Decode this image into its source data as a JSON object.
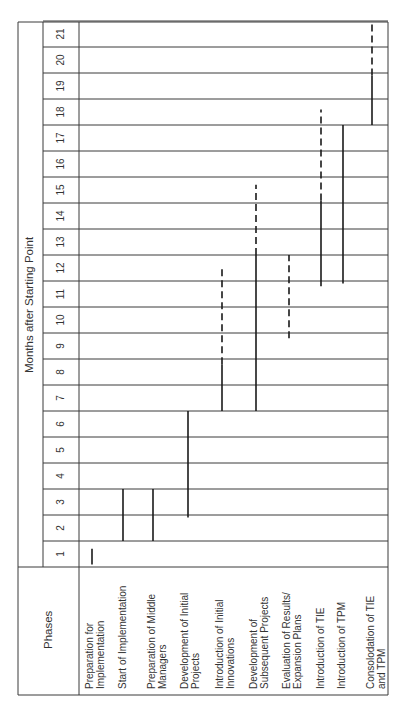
{
  "chart_data": {
    "type": "gantt",
    "orientation": "rotated 90deg counter-clockwise (months run bottom-to-top, phases left-to-right)",
    "title": "",
    "row_header": "Phases",
    "column_header": "Months after Starting Point",
    "months": [
      "1",
      "2",
      "3",
      "4",
      "5",
      "6",
      "7",
      "8",
      "9",
      "10",
      "11",
      "12",
      "13",
      "14",
      "15",
      "16",
      "17",
      "18",
      "19",
      "20",
      "21"
    ],
    "legend": {
      "solid": "planned / firm",
      "dashed": "tentative / continuation"
    },
    "phases": [
      {
        "label": "Preparation for\nImplementation",
        "segments": [
          {
            "start": 0.1,
            "end": 0.7,
            "style": "solid"
          }
        ]
      },
      {
        "label": "Start of Implementation",
        "segments": [
          {
            "start": 1.0,
            "end": 3.0,
            "style": "solid"
          }
        ]
      },
      {
        "label": "Preparation of Middle\nManagers",
        "segments": [
          {
            "start": 1.0,
            "end": 3.0,
            "style": "solid"
          }
        ]
      },
      {
        "label": "Development of Initial\nProjects",
        "segments": [
          {
            "start": 1.9,
            "end": 6.0,
            "style": "solid"
          }
        ]
      },
      {
        "label": "Introduction of Initial\nInnovations",
        "segments": [
          {
            "start": 6.0,
            "end": 7.8,
            "style": "solid"
          },
          {
            "start": 7.8,
            "end": 11.5,
            "style": "dashed"
          }
        ]
      },
      {
        "label": "Development of\nSubsequent Projects",
        "segments": [
          {
            "start": 6.0,
            "end": 12.0,
            "style": "solid"
          },
          {
            "start": 12.0,
            "end": 14.7,
            "style": "dashed"
          }
        ]
      },
      {
        "label": "Evaluation of Results/\nExpansion Plans",
        "segments": [
          {
            "start": 8.8,
            "end": 12.0,
            "style": "dashed"
          }
        ]
      },
      {
        "label": "Introduction of TIE",
        "segments": [
          {
            "start": 10.8,
            "end": 14.1,
            "style": "solid"
          },
          {
            "start": 14.1,
            "end": 17.6,
            "style": "dashed"
          }
        ]
      },
      {
        "label": "Introduction of TPM",
        "segments": [
          {
            "start": 10.9,
            "end": 17.0,
            "style": "solid"
          }
        ]
      },
      {
        "label": "Consolodation of TIE\nand TPM",
        "segments": [
          {
            "start": 17.0,
            "end": 18.9,
            "style": "solid"
          },
          {
            "start": 18.9,
            "end": 21.0,
            "style": "dashed"
          }
        ]
      }
    ],
    "grid": true
  },
  "layout": {
    "line_color": "#3a3a3a",
    "bar_color": "#1a1a1a"
  }
}
